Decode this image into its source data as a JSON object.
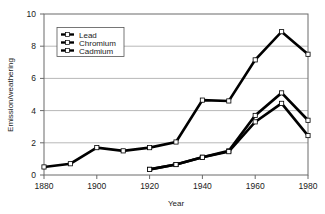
{
  "chart_data": {
    "type": "line",
    "title": "",
    "xlabel": "Year",
    "ylabel": "Emission/weathering",
    "xlim": [
      1880,
      1980
    ],
    "ylim": [
      0,
      10
    ],
    "xticks": [
      1880,
      1900,
      1920,
      1940,
      1960,
      1980
    ],
    "yticks": [
      0,
      2,
      4,
      6,
      8,
      10
    ],
    "xtick_labels": [
      "1880",
      "1900",
      "1920",
      "1940",
      "1960",
      "1980"
    ],
    "ytick_labels": [
      "0",
      "2",
      "4",
      "6",
      "8",
      "10"
    ],
    "grid": "horizontal",
    "legend_position": "top-left-inside",
    "legend_entries": [
      "Lead",
      "Chromium",
      "Cadmium"
    ],
    "marker": "open-square",
    "line_color": "#000000",
    "grid_color": "#9a9a9a",
    "frame_color": "#6a6a6a",
    "series": [
      {
        "name": "Lead",
        "x": [
          1880,
          1890,
          1900,
          1910,
          1920,
          1930,
          1940,
          1950,
          1960,
          1970,
          1980
        ],
        "values": [
          0.5,
          0.7,
          1.7,
          1.5,
          1.7,
          2.05,
          4.65,
          4.6,
          7.15,
          8.9,
          7.5
        ]
      },
      {
        "name": "Chromium",
        "x": [
          1920,
          1930,
          1940,
          1950,
          1960,
          1970,
          1980
        ],
        "values": [
          0.35,
          0.65,
          1.1,
          1.5,
          3.7,
          5.1,
          3.4
        ]
      },
      {
        "name": "Cadmium",
        "x": [
          1920,
          1930,
          1940,
          1950,
          1960,
          1970,
          1980
        ],
        "values": [
          0.35,
          0.65,
          1.1,
          1.45,
          3.3,
          4.45,
          2.45
        ]
      }
    ]
  },
  "axes": {
    "ylabel": "Emission/weathering",
    "xlabel": "Year",
    "ytick_0": "0",
    "ytick_1": "2",
    "ytick_2": "4",
    "ytick_3": "6",
    "ytick_4": "8",
    "ytick_5": "10",
    "xtick_0": "1880",
    "xtick_1": "1900",
    "xtick_2": "1920",
    "xtick_3": "1940",
    "xtick_4": "1960",
    "xtick_5": "1980"
  },
  "legend": {
    "item_0": "Lead",
    "item_1": "Chromium",
    "item_2": "Cadmium"
  }
}
